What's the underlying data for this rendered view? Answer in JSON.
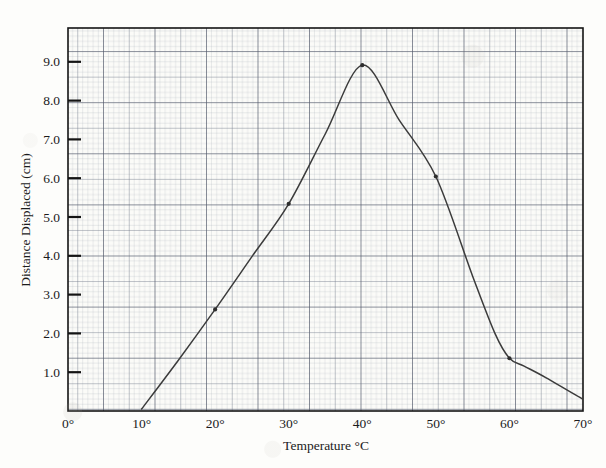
{
  "figure": {
    "kind": "scanned-graph-paper-plot",
    "background_color": "#fdfdfb",
    "grid_color": "#8e93a3",
    "curve_color": "#3a3a3a",
    "axis_color": "#111111"
  },
  "chart_data": {
    "type": "line",
    "title": "",
    "subtitle": "",
    "xlabel": "Temperature °C",
    "ylabel": "Distance Displaced (cm)",
    "xlim": [
      0,
      70
    ],
    "ylim": [
      0,
      9.8
    ],
    "grid": true,
    "grid_style": "graph-paper (fine 1mm, medium 5mm, heavy 10mm)",
    "legend": "none",
    "x_tick_labels": [
      "0°",
      "10°",
      "20°",
      "30°",
      "40°",
      "50°",
      "60°",
      "70°"
    ],
    "x_tick_values": [
      0,
      10,
      20,
      30,
      40,
      50,
      60,
      70
    ],
    "y_tick_labels": [
      "1.0",
      "2.0",
      "3.0",
      "4.0",
      "5.0",
      "6.0",
      "7.0",
      "8.0",
      "9.0"
    ],
    "y_tick_values": [
      1.0,
      2.0,
      3.0,
      4.0,
      5.0,
      6.0,
      7.0,
      8.0,
      9.0
    ],
    "series": [
      {
        "name": "Distance displaced vs temperature",
        "marker": "dot",
        "x": [
          10,
          15,
          20,
          25,
          30,
          35,
          40,
          45,
          50,
          55,
          58,
          60,
          62,
          65,
          70
        ],
        "values": [
          0.05,
          1.3,
          2.6,
          3.95,
          5.3,
          7.1,
          8.85,
          7.45,
          6.0,
          3.45,
          2.0,
          1.35,
          1.15,
          0.85,
          0.3
        ]
      }
    ],
    "marked_points": [
      {
        "x": 20,
        "y": 2.6
      },
      {
        "x": 30,
        "y": 5.3
      },
      {
        "x": 40,
        "y": 8.85
      },
      {
        "x": 50,
        "y": 6.0
      },
      {
        "x": 60,
        "y": 1.35
      }
    ],
    "annotations": []
  }
}
